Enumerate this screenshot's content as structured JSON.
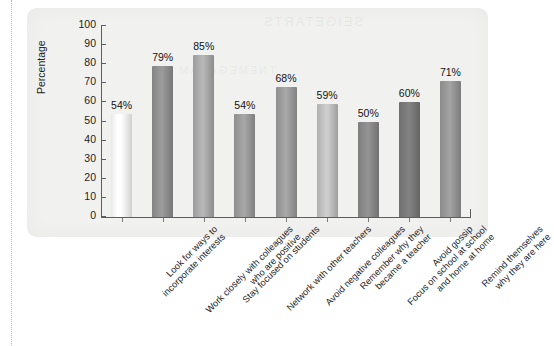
{
  "page": {
    "background_color": "#ffffff",
    "panel_background_color": "#f1f1f0",
    "scan_bleed_text": "SEIGETARTS",
    "scan_bleed_text_2": "TNEMEGANAM"
  },
  "chart_data": {
    "type": "bar",
    "title": "",
    "xlabel": "",
    "ylabel": "Percentage",
    "ylim": [
      0,
      100
    ],
    "ytick_values": [
      0,
      10,
      20,
      30,
      40,
      50,
      60,
      70,
      80,
      90,
      100
    ],
    "ytick_labels": [
      "0",
      "10",
      "20",
      "30",
      "40",
      "50",
      "60",
      "70",
      "80",
      "90",
      "100"
    ],
    "grid": false,
    "legend": false,
    "value_label_suffix": "%",
    "categories": [
      "Look for ways to\nincorporate interests",
      "Work closely with colleagues\nwho are positive",
      "Stay focused on students",
      "Network with other teachers",
      "Avoid negative colleagues",
      "Remember why they\nbecame a teacher",
      "Focus on school at school\nand home at home",
      "Avoid gossip",
      "Remind themselves\nwhy they are here"
    ],
    "values": [
      54,
      79,
      85,
      54,
      68,
      59,
      50,
      60,
      71
    ],
    "value_labels": [
      "54%",
      "79%",
      "85%",
      "54%",
      "68%",
      "59%",
      "50%",
      "60%",
      "71%"
    ],
    "bar_colors": [
      "#e8e8e8",
      "#848484",
      "#9c9c9c",
      "#8e8e8e",
      "#8f8f8f",
      "#b0b0b0",
      "#7d7d7d",
      "#6f6f6f",
      "#8a8a8a"
    ]
  },
  "category_lines": [
    [
      "Look for ways to",
      "incorporate interests"
    ],
    [
      "Work closely with colleagues",
      "who are positive"
    ],
    [
      "Stay focused on students"
    ],
    [
      "Network with other teachers"
    ],
    [
      "Avoid negative colleagues"
    ],
    [
      "Remember why they",
      "became a teacher"
    ],
    [
      "Focus on school at school",
      "and home at home"
    ],
    [
      "Avoid gossip"
    ],
    [
      "Remind themselves",
      "why they are here"
    ]
  ]
}
